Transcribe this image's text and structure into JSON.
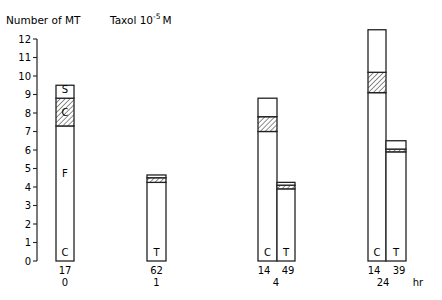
{
  "chart_data": {
    "type": "bar",
    "subtype": "stacked-grouped",
    "title": "Number of MT",
    "subtitle": "Taxol 10-5 M",
    "subtitle_parts": {
      "text": "Taxol 10",
      "exponent": "-5",
      "unit": "M"
    },
    "ylabel": "Number of MT",
    "xlabel": "hr",
    "ylim": [
      0,
      12
    ],
    "yticks": [
      0,
      1,
      2,
      3,
      4,
      5,
      6,
      7,
      8,
      9,
      10,
      11,
      12
    ],
    "grid": false,
    "legend": null,
    "segment_styles": {
      "open": "white fill, black outline",
      "hatched": "diagonal hatch"
    },
    "groups": [
      {
        "time": "0",
        "bars": [
          {
            "condition": "C",
            "n": "17",
            "segments": [
              {
                "from": 0,
                "to": 7.3,
                "style": "open",
                "label": "F"
              },
              {
                "from": 7.3,
                "to": 8.8,
                "style": "hatched",
                "label": "C"
              },
              {
                "from": 8.8,
                "to": 9.5,
                "style": "open",
                "label": "S"
              }
            ],
            "total": 9.5
          }
        ]
      },
      {
        "time": "1",
        "bars": [
          {
            "condition": "T",
            "n": "62",
            "segments": [
              {
                "from": 0,
                "to": 4.25,
                "style": "open",
                "label": ""
              },
              {
                "from": 4.25,
                "to": 4.5,
                "style": "hatched",
                "label": ""
              },
              {
                "from": 4.5,
                "to": 4.65,
                "style": "open",
                "label": ""
              }
            ],
            "total": 4.65
          }
        ]
      },
      {
        "time": "4",
        "bars": [
          {
            "condition": "C",
            "n": "14",
            "segments": [
              {
                "from": 0,
                "to": 7.0,
                "style": "open",
                "label": ""
              },
              {
                "from": 7.0,
                "to": 7.8,
                "style": "hatched",
                "label": ""
              },
              {
                "from": 7.8,
                "to": 8.8,
                "style": "open",
                "label": ""
              }
            ],
            "total": 8.8
          },
          {
            "condition": "T",
            "n": "49",
            "segments": [
              {
                "from": 0,
                "to": 3.9,
                "style": "open",
                "label": ""
              },
              {
                "from": 3.9,
                "to": 4.1,
                "style": "hatched",
                "label": ""
              },
              {
                "from": 4.1,
                "to": 4.25,
                "style": "open",
                "label": ""
              }
            ],
            "total": 4.25
          }
        ]
      },
      {
        "time": "24",
        "bars": [
          {
            "condition": "C",
            "n": "14",
            "segments": [
              {
                "from": 0,
                "to": 9.1,
                "style": "open",
                "label": ""
              },
              {
                "from": 9.1,
                "to": 10.2,
                "style": "hatched",
                "label": ""
              },
              {
                "from": 10.2,
                "to": 12.5,
                "style": "open",
                "label": ""
              }
            ],
            "total": 12.5
          },
          {
            "condition": "T",
            "n": "39",
            "segments": [
              {
                "from": 0,
                "to": 5.9,
                "style": "open",
                "label": ""
              },
              {
                "from": 5.9,
                "to": 6.05,
                "style": "hatched",
                "label": ""
              },
              {
                "from": 6.05,
                "to": 6.5,
                "style": "open",
                "label": ""
              }
            ],
            "total": 6.5
          }
        ]
      }
    ]
  },
  "layout": {
    "axis_x": 37,
    "zero_y": 261,
    "px_per_unit": 18.5,
    "bars": [
      {
        "group": 0,
        "bar": 0,
        "x": 56,
        "w": 18
      },
      {
        "group": 1,
        "bar": 0,
        "x": 147,
        "w": 19
      },
      {
        "group": 2,
        "bar": 0,
        "x": 258,
        "w": 19
      },
      {
        "group": 2,
        "bar": 1,
        "x": 277,
        "w": 18
      },
      {
        "group": 3,
        "bar": 0,
        "x": 368,
        "w": 18
      },
      {
        "group": 3,
        "bar": 1,
        "x": 386,
        "w": 20
      }
    ],
    "inner_labels": [
      {
        "text": "S",
        "x": 65,
        "y": 93
      },
      {
        "text": "C",
        "x": 65,
        "y": 116
      },
      {
        "text": "F",
        "x": 65,
        "y": 177
      },
      {
        "text": "C",
        "x": 65,
        "y": 256
      },
      {
        "text": "T",
        "x": 156.5,
        "y": 256
      },
      {
        "text": "C",
        "x": 267.5,
        "y": 256
      },
      {
        "text": "T",
        "x": 286,
        "y": 256
      },
      {
        "text": "C",
        "x": 377,
        "y": 256
      },
      {
        "text": "T",
        "x": 396,
        "y": 256
      }
    ],
    "count_labels": [
      {
        "text": "17",
        "x": 65
      },
      {
        "text": "62",
        "x": 156.5
      },
      {
        "text": "14",
        "x": 264
      },
      {
        "text": "49",
        "x": 288
      },
      {
        "text": "14",
        "x": 374
      },
      {
        "text": "39",
        "x": 399
      }
    ],
    "time_labels": [
      {
        "text": "0",
        "x": 65
      },
      {
        "text": "1",
        "x": 156.5
      },
      {
        "text": "4",
        "x": 276
      },
      {
        "text": "24",
        "x": 383
      },
      {
        "text": "hr",
        "x": 418
      }
    ]
  }
}
